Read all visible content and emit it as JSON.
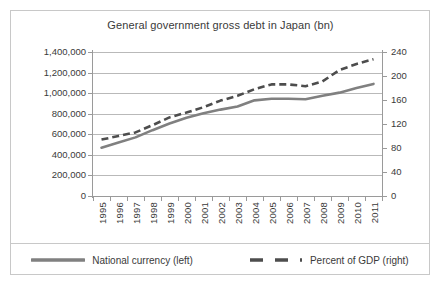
{
  "chart_data": {
    "type": "line",
    "title": "General government gross debt in Japan (bn)",
    "xlabel": "",
    "ylabel": "",
    "grid": true,
    "legend_position": "bottom",
    "categories": [
      "1995",
      "1996",
      "1997",
      "1998",
      "1999",
      "2000",
      "2001",
      "2002",
      "2003",
      "2004",
      "2005",
      "2006",
      "2007",
      "2008",
      "2009",
      "2010",
      "2011"
    ],
    "x": [
      1995,
      1996,
      1997,
      1998,
      1999,
      2000,
      2001,
      2002,
      2003,
      2004,
      2005,
      2006,
      2007,
      2008,
      2009,
      2010,
      2011
    ],
    "axes": {
      "left": {
        "label": "National currency (bn)",
        "ylim": [
          0,
          1400000
        ],
        "ticks": [
          0,
          200000,
          400000,
          600000,
          800000,
          1000000,
          1200000,
          1400000
        ],
        "ticklabels": [
          "0",
          "200,000",
          "400,000",
          "600,000",
          "800,000",
          "1,000,000",
          "1,200,000",
          "1,400,000"
        ]
      },
      "right": {
        "label": "Percent of GDP",
        "ylim": [
          0,
          240
        ],
        "ticks": [
          0,
          40,
          80,
          120,
          160,
          200,
          240
        ],
        "ticklabels": [
          "0",
          "40",
          "80",
          "120",
          "160",
          "200",
          "240"
        ]
      }
    },
    "series": [
      {
        "name": "National currency (left)",
        "axis": "left",
        "style": "solid",
        "color": "#808080",
        "values": [
          470000,
          520000,
          570000,
          640000,
          705000,
          760000,
          805000,
          840000,
          870000,
          930000,
          945000,
          945000,
          940000,
          975000,
          1005000,
          1050000,
          1090000
        ]
      },
      {
        "name": "Percent of GDP (right)",
        "axis": "right",
        "style": "dashed",
        "color": "#4d4d4d",
        "values": [
          94,
          100,
          106,
          118,
          131,
          139,
          148,
          159,
          167,
          178,
          186,
          186,
          183,
          191,
          210,
          220,
          228
        ]
      }
    ]
  },
  "legend": {
    "items": [
      {
        "label": "National currency (left)",
        "style": "solid",
        "color": "#808080"
      },
      {
        "label": "Percent of GDP (right)",
        "style": "dashed",
        "color": "#4d4d4d"
      }
    ]
  }
}
